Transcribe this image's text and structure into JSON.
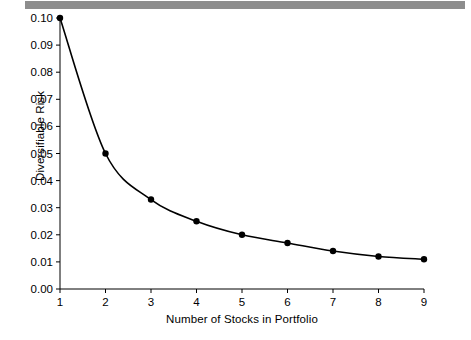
{
  "figure": {
    "background_color": "#ffffff",
    "band_color": "#8d8d8d",
    "line_color": "#000000",
    "marker_color": "#000000"
  },
  "chart_data": {
    "type": "line",
    "title": "",
    "subtitle": "",
    "xlabel": "Number of Stocks in Portfolio",
    "ylabel": "Diversifiable Risk",
    "x": [
      1,
      2,
      3,
      4,
      5,
      6,
      7,
      8,
      9
    ],
    "values": [
      0.1,
      0.05,
      0.033,
      0.025,
      0.02,
      0.017,
      0.014,
      0.012,
      0.011
    ],
    "series": [
      {
        "name": "Diversifiable Risk",
        "values": [
          0.1,
          0.05,
          0.033,
          0.025,
          0.02,
          0.017,
          0.014,
          0.012,
          0.011
        ]
      }
    ],
    "xlim": [
      1,
      9
    ],
    "ylim": [
      0.0,
      0.1
    ],
    "xticks": [
      1,
      2,
      3,
      4,
      5,
      6,
      7,
      8,
      9
    ],
    "xticklabels": [
      "1",
      "2",
      "3",
      "4",
      "5",
      "6",
      "7",
      "8",
      "9"
    ],
    "yticks": [
      0.0,
      0.01,
      0.02,
      0.03,
      0.04,
      0.05,
      0.06,
      0.07,
      0.08,
      0.09,
      0.1
    ],
    "yticklabels": [
      "0.00",
      "0.01",
      "0.02",
      "0.03",
      "0.04",
      "0.05",
      "0.06",
      "0.07",
      "0.08",
      "0.09",
      "0.10"
    ],
    "grid": false,
    "legend": null,
    "markers": "filled-circle",
    "annotations": []
  }
}
